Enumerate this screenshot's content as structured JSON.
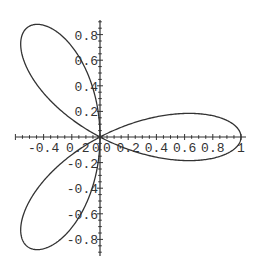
{
  "chart_data": {
    "type": "line",
    "title": "",
    "equation": "r = cos(3*theta)",
    "xlabel": "",
    "ylabel": "",
    "xlim": [
      -0.6,
      1.03
    ],
    "ylim": [
      -0.92,
      0.92
    ],
    "grid": false,
    "legend": null,
    "x_ticks": [
      -0.4,
      -0.2,
      0,
      0.2,
      0.4,
      0.6,
      0.8,
      1
    ],
    "x_tick_labels": [
      "-0.4",
      "0.2",
      "0",
      "0",
      "0.2",
      "0.4",
      "0.6",
      "0.8",
      "1"
    ],
    "x_tick_label_text": "-0.40.2000 0.20.40.60.8 1",
    "y_ticks": [
      0.8,
      0.6,
      0.4,
      0.2,
      -0.2,
      -0.4,
      -0.6,
      -0.8
    ],
    "y_tick_labels": [
      "0.8",
      "0.6",
      "0.4",
      "0.2",
      "-0.2",
      "-0.4",
      "-0.6",
      "-0.8"
    ],
    "series": [
      {
        "name": "rose",
        "petals": [
          {
            "tip_x": 1.0,
            "tip_y": 0.0
          },
          {
            "tip_x": -0.5,
            "tip_y": 0.866
          },
          {
            "tip_x": -0.5,
            "tip_y": -0.866
          }
        ]
      }
    ],
    "line_color": "#333333"
  },
  "axis_labels": {
    "x": [
      "-0.4",
      "0.2",
      "0",
      "0",
      "0.2",
      "0.4",
      "0.6",
      "0.8",
      "1"
    ],
    "y": [
      "0.8",
      "0.6",
      "0.4",
      "0.2",
      "-0.2",
      "-0.4",
      "-0.6",
      "-0.8"
    ]
  }
}
